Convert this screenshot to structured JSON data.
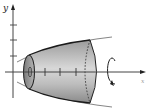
{
  "figure": {
    "axes": {
      "y_label": "y",
      "x_label": "x",
      "y_ticks": 3,
      "x_ticks": 3
    },
    "colors": {
      "axis": "#333333",
      "solid_fill_dark": "#8c8c8c",
      "solid_fill_light": "#dcdcdc",
      "outline": "#1a1a1a",
      "curve_extension": "#777777"
    },
    "rotation_indicator": "circular-arrow-about-x-axis"
  }
}
